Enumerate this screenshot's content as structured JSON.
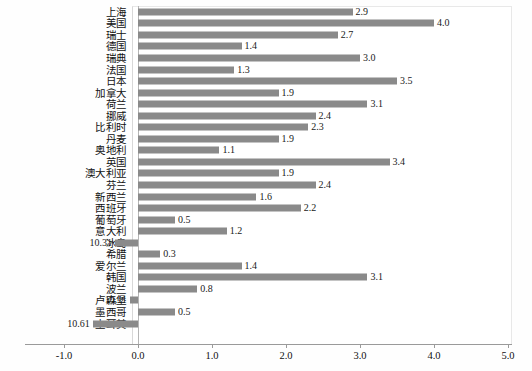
{
  "chart_data": {
    "type": "bar",
    "orientation": "horizontal",
    "title": "",
    "subtitle": "",
    "xlabel": "",
    "ylabel": "",
    "xlim": [
      -1.0,
      5.0
    ],
    "grid": false,
    "legend": null,
    "bar_color": "#8a8a8a",
    "axis_ticks": [
      "-1.0",
      "0.0",
      "1.0",
      "2.0",
      "3.0",
      "4.0",
      "5.0"
    ],
    "axis_tick_values": [
      -1.0,
      0.0,
      1.0,
      2.0,
      3.0,
      4.0,
      5.0
    ],
    "categories": [
      "上海",
      "美国",
      "瑞士",
      "德国",
      "瑞典",
      "法国",
      "日本",
      "加拿大",
      "荷兰",
      "挪威",
      "比利时",
      "丹麦",
      "奥地利",
      "英国",
      "澳大利亚",
      "芬兰",
      "新西兰",
      "西班牙",
      "葡萄牙",
      "意大利",
      "冰岛",
      "希腊",
      "爱尔兰",
      "韩国",
      "波兰",
      "卢森堡",
      "墨西哥",
      "土耳其"
    ],
    "values": [
      2.9,
      4.0,
      2.7,
      1.4,
      3.0,
      1.3,
      3.5,
      1.9,
      3.1,
      2.4,
      2.3,
      1.9,
      1.1,
      3.4,
      1.9,
      2.4,
      1.6,
      2.2,
      0.5,
      1.2,
      -0.31,
      0.3,
      1.4,
      3.1,
      0.8,
      -0.11,
      0.5,
      -0.61
    ],
    "value_labels": [
      "2.9",
      "4.0",
      "2.7",
      "1.4",
      "3.0",
      "1.3",
      "3.5",
      "1.9",
      "3.1",
      "2.4",
      "2.3",
      "1.9",
      "1.1",
      "3.4",
      "1.9",
      "2.4",
      "1.6",
      "2.2",
      "0.5",
      "1.2",
      "10.31",
      "0.3",
      "1.4",
      "3.1",
      "0.8",
      "10.11",
      "0.5",
      "10.61"
    ]
  }
}
